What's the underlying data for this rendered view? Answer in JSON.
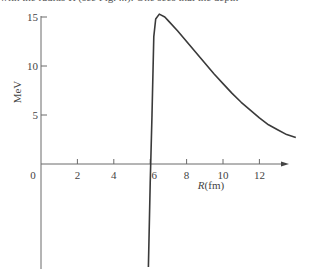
{
  "page": {
    "clipped_text": "with the radius R (see Fig. ...). One sees that the depth"
  },
  "chart_data": {
    "type": "line",
    "title": "",
    "xlabel": "R(fm)",
    "ylabel": "MeV",
    "xlim": [
      0,
      14
    ],
    "ylim": [
      -10.5,
      15.5
    ],
    "x_ticks": [
      0,
      2,
      4,
      6,
      8,
      10,
      12
    ],
    "x_tick_labels": [
      "0",
      "2",
      "4",
      "6",
      "8",
      "10",
      "12"
    ],
    "y_ticks": [
      5,
      10,
      15
    ],
    "y_tick_labels": [
      "5",
      "10",
      "15"
    ],
    "grid": false,
    "legend": null,
    "series": [
      {
        "name": "potential",
        "x": [
          5.9,
          6.0,
          6.1,
          6.2,
          6.3,
          6.5,
          6.8,
          7.0,
          7.5,
          8.0,
          8.5,
          9.0,
          9.5,
          10.0,
          10.5,
          11.0,
          11.5,
          12.0,
          12.5,
          13.0,
          13.5,
          14.0
        ],
        "y": [
          -10.5,
          -2.0,
          5.0,
          13.0,
          14.8,
          15.3,
          15.0,
          14.6,
          13.6,
          12.5,
          11.4,
          10.3,
          9.2,
          8.2,
          7.2,
          6.3,
          5.5,
          4.7,
          4.0,
          3.5,
          3.0,
          2.7
        ]
      }
    ],
    "annotations": []
  },
  "colors": {
    "curve": "#3a3a3a",
    "axis": "#6a6a6a",
    "text": "#444444"
  }
}
